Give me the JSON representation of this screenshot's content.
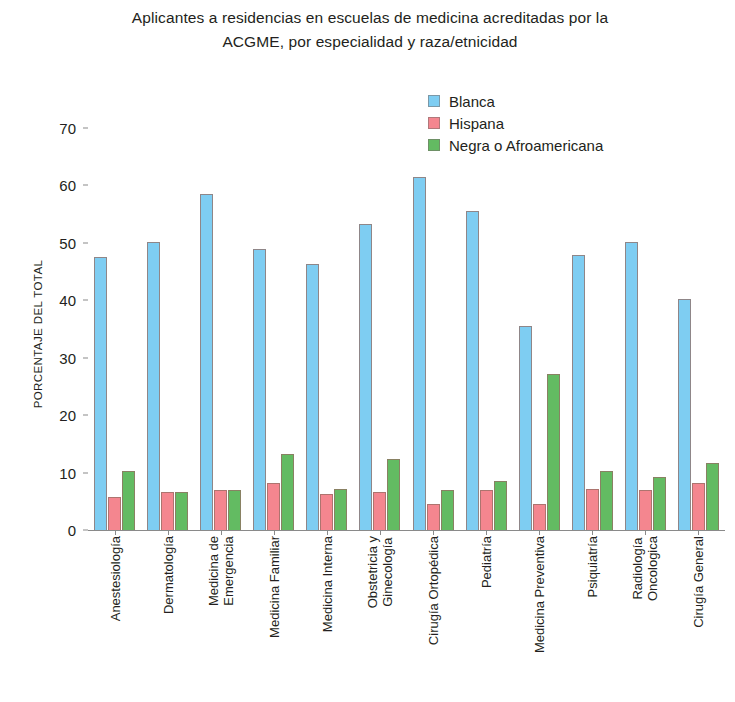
{
  "chart_data": {
    "type": "bar",
    "title": "Aplicantes a residencias en escuelas de medicina acreditadas por la ACGME, por especialidad y raza/etnicidad",
    "title_lines": [
      "Aplicantes a residencias en escuelas de medicina acreditadas por la",
      "ACGME, por especialidad y raza/etnicidad"
    ],
    "xlabel": "",
    "ylabel": "PORCENTAJE DEL TOTAL",
    "ylim": [
      0,
      70
    ],
    "yticks": [
      0,
      10,
      20,
      30,
      40,
      50,
      60,
      70
    ],
    "ytick_labels": [
      "0",
      "10",
      "20",
      "30",
      "40",
      "50",
      "60",
      "70"
    ],
    "grid": false,
    "legend_position": "top-center",
    "categories": [
      "Anestesiología",
      "Dermatología",
      "Medicina de Emergencia",
      "Medicina Familiar",
      "Medicina Interna",
      "Obstetricia y Ginecología",
      "Cirugía Ortopédica",
      "Pediatría",
      "Medicina Preventiva",
      "Psiquiatría",
      "Radiología Oncologica",
      "Cirugía General"
    ],
    "category_lines": [
      [
        "Anestesiología",
        ""
      ],
      [
        "Dermatología",
        ""
      ],
      [
        "Medicina de",
        "Emergencia"
      ],
      [
        "Medicina Familiar",
        ""
      ],
      [
        "Medicina Interna",
        ""
      ],
      [
        "Obstetricia y",
        "Ginecología"
      ],
      [
        "Cirugía Ortopédica",
        ""
      ],
      [
        "Pediatría",
        ""
      ],
      [
        "Medicina Preventiva",
        ""
      ],
      [
        "Psiquiatría",
        ""
      ],
      [
        "Radiología",
        "Oncologica"
      ],
      [
        "Cirugía General",
        ""
      ]
    ],
    "series": [
      {
        "name": "Blanca",
        "color": "#7ecdf2",
        "values": [
          47.5,
          50.2,
          58.5,
          49.0,
          46.4,
          53.2,
          61.5,
          55.5,
          35.5,
          47.9,
          50.2,
          40.2
        ]
      },
      {
        "name": "Hispana",
        "color": "#f4868f",
        "values": [
          5.8,
          6.7,
          6.9,
          8.2,
          6.3,
          6.7,
          4.5,
          7.0,
          4.5,
          7.2,
          6.9,
          8.2
        ]
      },
      {
        "name": "Negra o Afroamericana",
        "color": "#63bb62",
        "values": [
          10.3,
          6.6,
          7.0,
          13.2,
          7.2,
          12.3,
          6.9,
          8.6,
          27.2,
          10.3,
          9.3,
          11.7
        ]
      }
    ]
  }
}
